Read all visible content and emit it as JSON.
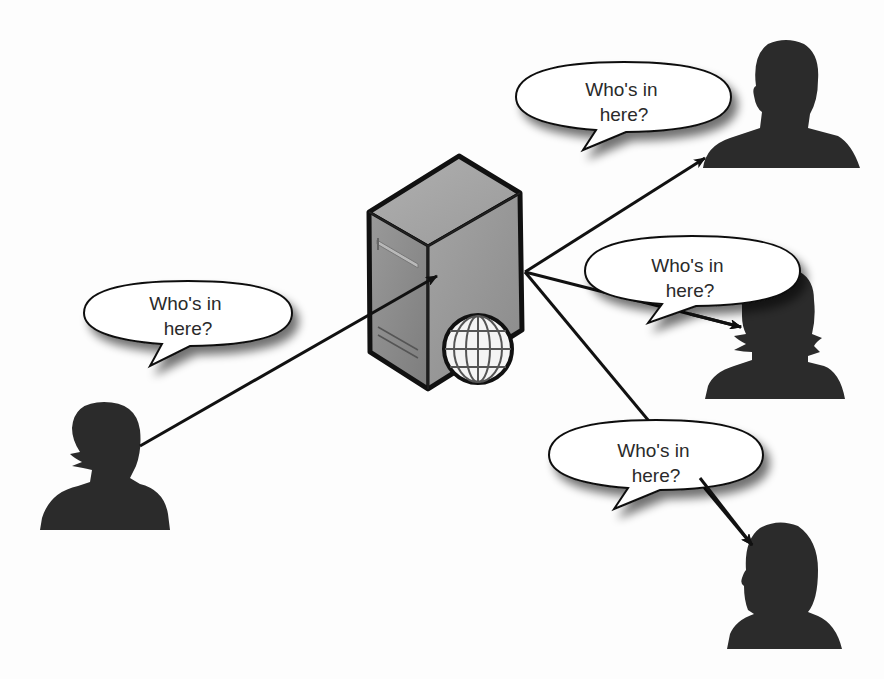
{
  "diagram": {
    "colors": {
      "background": "#fdfdfd",
      "silhouette": "#2b2b2b",
      "server_front": "#8c8c8c",
      "server_side": "#9d9d9d",
      "server_top": "#a8a8a8",
      "outline": "#111111",
      "bubble_fill": "#ffffff",
      "globe_fill": "#f4f4f4",
      "globe_lines": "#555555"
    },
    "server": {
      "label": "web-server",
      "icon": "server-with-globe-icon"
    },
    "bubbles": [
      {
        "id": "bubble-left",
        "line1": "Who's in",
        "line2": "here?"
      },
      {
        "id": "bubble-top-right",
        "line1": "Who's in",
        "line2": "here?"
      },
      {
        "id": "bubble-middle-right",
        "line1": "Who's in",
        "line2": "here?"
      },
      {
        "id": "bubble-bottom-right",
        "line1": "Who's in",
        "line2": "here?"
      }
    ],
    "people": [
      {
        "id": "person-left",
        "icon": "woman-silhouette-icon"
      },
      {
        "id": "person-top-right",
        "icon": "man-silhouette-icon"
      },
      {
        "id": "person-middle-right",
        "icon": "woman-silhouette-icon"
      },
      {
        "id": "person-bottom-right",
        "icon": "woman-silhouette-icon"
      }
    ],
    "arrows": [
      {
        "from": "person-left",
        "to": "server"
      },
      {
        "from": "server",
        "to": "person-top-right"
      },
      {
        "from": "server",
        "to": "person-middle-right"
      },
      {
        "from": "server",
        "to": "person-bottom-right"
      }
    ]
  }
}
